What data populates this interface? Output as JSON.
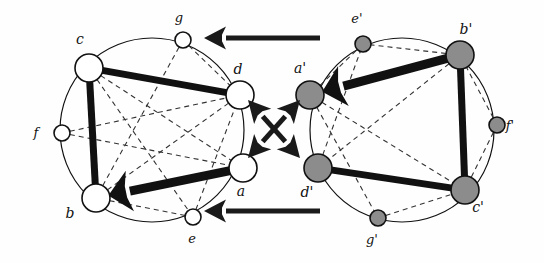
{
  "figure": {
    "background_color": "#fefefe",
    "node_fill_left": "#ffffff",
    "node_fill_right": "#8c8c8c",
    "node_stroke": "#111111",
    "solid_edge_color": "#111111",
    "dashed_edge_color": "#333333",
    "circle_stroke": "#111111",
    "arrow_color": "#1a1a1a"
  },
  "left_graph": {
    "name": "G",
    "node_style": "hollow-white",
    "circle": {
      "cx": 152,
      "cy": 130,
      "r": 92
    },
    "nodes": [
      {
        "id": "a",
        "label": "a",
        "cx": 243,
        "cy": 168,
        "r": 14,
        "size": "large",
        "label_x": 241,
        "label_y": 196
      },
      {
        "id": "b",
        "label": "b",
        "cx": 96,
        "cy": 198,
        "r": 14,
        "size": "large",
        "label_x": 70,
        "label_y": 218
      },
      {
        "id": "c",
        "label": "c",
        "cx": 89,
        "cy": 68,
        "r": 14,
        "size": "large",
        "label_x": 80,
        "label_y": 44
      },
      {
        "id": "d",
        "label": "d",
        "cx": 240,
        "cy": 95,
        "r": 14,
        "size": "large",
        "label_x": 238,
        "label_y": 74
      },
      {
        "id": "e",
        "label": "e",
        "cx": 193,
        "cy": 217,
        "r": 8,
        "size": "small",
        "label_x": 192,
        "label_y": 243
      },
      {
        "id": "f",
        "label": "f",
        "cx": 62,
        "cy": 133,
        "r": 8,
        "size": "small",
        "label_x": 36,
        "label_y": 137
      },
      {
        "id": "g",
        "label": "g",
        "cx": 183,
        "cy": 40,
        "r": 8,
        "size": "small",
        "label_x": 179,
        "label_y": 22
      }
    ],
    "solid_edges": [
      {
        "from": "c",
        "to": "b",
        "width": 7
      },
      {
        "from": "c",
        "to": "d",
        "width": 7
      }
    ],
    "arrow_edges": [
      {
        "from": "a",
        "to": "b",
        "width": 9,
        "head": "to"
      }
    ],
    "dashed_edges": [
      {
        "from": "c",
        "to": "a"
      },
      {
        "from": "c",
        "to": "e"
      },
      {
        "from": "f",
        "to": "d"
      },
      {
        "from": "f",
        "to": "a"
      },
      {
        "from": "b",
        "to": "d"
      },
      {
        "from": "b",
        "to": "g"
      },
      {
        "from": "e",
        "to": "d"
      },
      {
        "from": "e",
        "to": "b"
      },
      {
        "from": "g",
        "to": "d"
      }
    ]
  },
  "right_graph": {
    "name": "G'",
    "node_style": "filled-gray",
    "circle": {
      "cx": 402,
      "cy": 130,
      "r": 92
    },
    "nodes": [
      {
        "id": "ap",
        "label": "a'",
        "cx": 310,
        "cy": 95,
        "r": 14,
        "size": "large",
        "label_x": 300,
        "label_y": 73
      },
      {
        "id": "bp",
        "label": "b'",
        "cx": 460,
        "cy": 55,
        "r": 14,
        "size": "large",
        "label_x": 466,
        "label_y": 34
      },
      {
        "id": "cp",
        "label": "c'",
        "cx": 465,
        "cy": 190,
        "r": 14,
        "size": "large",
        "label_x": 478,
        "label_y": 212
      },
      {
        "id": "dp",
        "label": "d'",
        "cx": 318,
        "cy": 168,
        "r": 14,
        "size": "large",
        "label_x": 307,
        "label_y": 197
      },
      {
        "id": "ep",
        "label": "e'",
        "cx": 363,
        "cy": 44,
        "r": 8,
        "size": "small",
        "label_x": 357,
        "label_y": 23
      },
      {
        "id": "fp",
        "label": "f'",
        "cx": 497,
        "cy": 125,
        "r": 8,
        "size": "small",
        "label_x": 510,
        "label_y": 130
      },
      {
        "id": "gp",
        "label": "g'",
        "cx": 378,
        "cy": 218,
        "r": 8,
        "size": "small",
        "label_x": 372,
        "label_y": 244
      }
    ],
    "solid_edges": [
      {
        "from": "bp",
        "to": "cp",
        "width": 7
      },
      {
        "from": "dp",
        "to": "cp",
        "width": 7
      }
    ],
    "arrow_edges": [
      {
        "from": "bp",
        "to": "ap",
        "width": 9,
        "head": "to"
      }
    ],
    "dashed_edges": [
      {
        "from": "bp",
        "to": "dp"
      },
      {
        "from": "bp",
        "to": "ep"
      },
      {
        "from": "fp",
        "to": "bp"
      },
      {
        "from": "fp",
        "to": "cp"
      },
      {
        "from": "ap",
        "to": "cp"
      },
      {
        "from": "ap",
        "to": "ep"
      },
      {
        "from": "ap",
        "to": "gp"
      },
      {
        "from": "dp",
        "to": "ep"
      },
      {
        "from": "gp",
        "to": "cp"
      }
    ]
  },
  "connectors": {
    "top_arrow": {
      "x1": 320,
      "y1": 38,
      "x2": 204,
      "y2": 38,
      "direction": "left",
      "width": 5
    },
    "bottom_arrow": {
      "x1": 320,
      "y1": 211,
      "x2": 204,
      "y2": 211,
      "direction": "left",
      "width": 5
    },
    "cross_arrow_1": {
      "x1": 248,
      "y1": 100,
      "x2": 300,
      "y2": 158,
      "direction": "both",
      "width": 5
    },
    "cross_arrow_2": {
      "x1": 248,
      "y1": 158,
      "x2": 300,
      "y2": 100,
      "direction": "both",
      "width": 5
    }
  }
}
